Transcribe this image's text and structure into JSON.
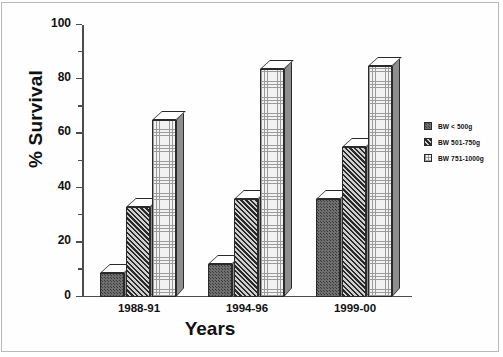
{
  "chart_data": {
    "type": "bar",
    "title": "",
    "subtitle": "",
    "xlabel": "Years",
    "ylabel": "% Survival",
    "categories": [
      "1988-91",
      "1994-96",
      "1999-00"
    ],
    "series": [
      {
        "name": "BW < 500g",
        "values": [
          9,
          12,
          36
        ]
      },
      {
        "name": "BW 501-750g",
        "values": [
          33,
          36,
          55
        ]
      },
      {
        "name": "BW 751-1000g",
        "values": [
          65,
          84,
          85
        ]
      }
    ],
    "ylim": [
      0,
      100
    ],
    "yticks": [
      0,
      20,
      40,
      60,
      80,
      100
    ],
    "yminorticks": [
      10,
      30,
      50,
      70,
      90
    ],
    "ytick_labels": [
      "0",
      "20",
      "40",
      "60",
      "80",
      "100"
    ],
    "grid": false,
    "legend_position": "right",
    "style": "3d-bar",
    "colors": {
      "series_1_fill": "#6f6f6f",
      "series_2_fill": "#3d3d3d",
      "series_3_fill": "#f2f2f2",
      "bar_top_face": "#ffffff",
      "bar_side_face": "#8e8e8e",
      "outline": "#2a2a2a",
      "axis": "#4d4d4d",
      "text": "#111111",
      "background": "#ffffff",
      "frame_border": "#b9b9b9"
    }
  },
  "legend": {
    "entries": [
      {
        "label": "BW < 500g"
      },
      {
        "label": "BW 501-750g"
      },
      {
        "label": "BW 751-1000g"
      }
    ]
  }
}
